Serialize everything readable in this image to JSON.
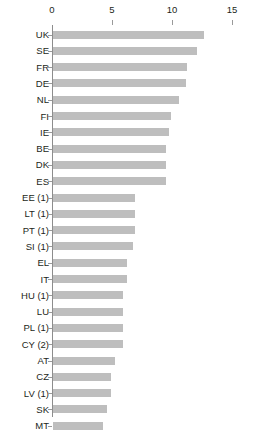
{
  "chart_data": {
    "type": "bar",
    "orientation": "horizontal",
    "title": "",
    "subtitle": "",
    "xlabel": "",
    "ylabel": "",
    "xlim": [
      0,
      15
    ],
    "xticks": [
      0,
      5,
      10,
      15
    ],
    "xtick_labels": [
      "0",
      "5",
      "10",
      "15"
    ],
    "grid": false,
    "legend": null,
    "axis_position": "top",
    "bar_color": "#bebebe",
    "categories": [
      "UK",
      "SE",
      "FR",
      "DE",
      "NL",
      "FI",
      "IE",
      "BE",
      "DK",
      "ES",
      "EE (1)",
      "LT (1)",
      "PT (1)",
      "SI (1)",
      "EL",
      "IT",
      "HU (1)",
      "LU",
      "PL (1)",
      "CY (2)",
      "AT",
      "CZ",
      "LV (1)",
      "SK",
      "MT"
    ],
    "values": [
      12.6,
      12.0,
      11.2,
      11.1,
      10.5,
      9.8,
      9.7,
      9.4,
      9.4,
      9.4,
      6.8,
      6.8,
      6.8,
      6.7,
      6.2,
      6.2,
      5.8,
      5.8,
      5.8,
      5.8,
      5.2,
      4.8,
      4.8,
      4.5,
      4.2
    ]
  }
}
